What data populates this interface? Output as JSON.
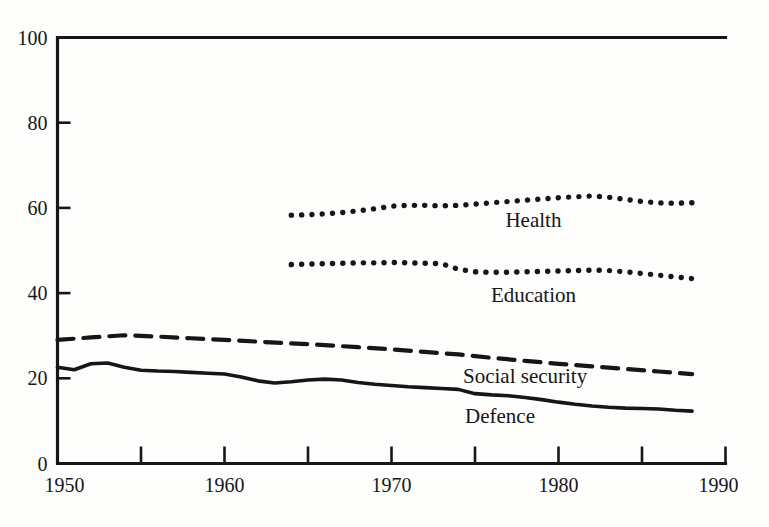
{
  "chart_data": {
    "type": "line",
    "title": "",
    "subtitle": "",
    "xlabel": "",
    "ylabel": "",
    "xlim": [
      1950,
      1990
    ],
    "ylim": [
      0,
      100
    ],
    "grid": false,
    "legend_position": "inline-labels",
    "x_ticks": [
      1950,
      1955,
      1960,
      1965,
      1970,
      1975,
      1980,
      1985,
      1990
    ],
    "x_tick_labels": [
      "1950",
      "",
      "1960",
      "",
      "1970",
      "",
      "1980",
      "",
      "1990"
    ],
    "y_ticks": [
      0,
      20,
      40,
      60,
      80,
      100
    ],
    "y_tick_labels": [
      "0",
      "20",
      "40",
      "60",
      "80",
      "100"
    ],
    "series": [
      {
        "name": "Health",
        "label": "Health",
        "style": "dotted",
        "color": "#16161a",
        "x": [
          1964,
          1965,
          1966,
          1967,
          1968,
          1969,
          1970,
          1971,
          1972,
          1973,
          1974,
          1975,
          1976,
          1977,
          1978,
          1979,
          1980,
          1981,
          1982,
          1983,
          1984,
          1985,
          1986,
          1987,
          1988
        ],
        "values": [
          58.3,
          58.4,
          58.6,
          58.9,
          59.3,
          59.8,
          60.4,
          60.6,
          60.6,
          60.5,
          60.6,
          60.9,
          61.2,
          61.5,
          61.8,
          62.1,
          62.4,
          62.6,
          62.8,
          62.5,
          62.0,
          61.5,
          61.2,
          61.1,
          61.2
        ]
      },
      {
        "name": "Education",
        "label": "Education",
        "style": "dotted",
        "color": "#16161a",
        "x": [
          1964,
          1965,
          1966,
          1967,
          1968,
          1969,
          1970,
          1971,
          1972,
          1973,
          1974,
          1975,
          1976,
          1977,
          1978,
          1979,
          1980,
          1981,
          1982,
          1983,
          1984,
          1985,
          1986,
          1987,
          1988
        ],
        "values": [
          46.7,
          46.8,
          46.9,
          47.0,
          47.1,
          47.1,
          47.2,
          47.1,
          47.0,
          46.9,
          45.6,
          45.0,
          44.9,
          44.9,
          45.0,
          45.1,
          45.2,
          45.3,
          45.4,
          45.3,
          45.0,
          44.6,
          44.2,
          43.8,
          43.4
        ]
      },
      {
        "name": "Social security",
        "label": "Social security",
        "style": "dashed",
        "color": "#16161a",
        "x": [
          1950,
          1952,
          1954,
          1956,
          1958,
          1960,
          1962,
          1964,
          1966,
          1968,
          1970,
          1972,
          1974,
          1976,
          1978,
          1980,
          1982,
          1984,
          1986,
          1988
        ],
        "values": [
          29.0,
          29.6,
          30.1,
          29.8,
          29.4,
          29.0,
          28.6,
          28.2,
          27.8,
          27.3,
          26.8,
          26.2,
          25.6,
          24.8,
          24.1,
          23.4,
          22.8,
          22.2,
          21.6,
          21.0
        ]
      },
      {
        "name": "Defence",
        "label": "Defence",
        "style": "solid",
        "color": "#16161a",
        "x": [
          1950,
          1951,
          1952,
          1953,
          1954,
          1955,
          1956,
          1957,
          1958,
          1959,
          1960,
          1961,
          1962,
          1963,
          1964,
          1965,
          1966,
          1967,
          1968,
          1969,
          1970,
          1971,
          1972,
          1973,
          1974,
          1975,
          1976,
          1977,
          1978,
          1979,
          1980,
          1981,
          1982,
          1983,
          1984,
          1985,
          1986,
          1987,
          1988
        ],
        "values": [
          22.6,
          22.0,
          23.4,
          23.6,
          22.6,
          21.9,
          21.7,
          21.6,
          21.4,
          21.2,
          21.0,
          20.3,
          19.4,
          18.9,
          19.2,
          19.6,
          19.8,
          19.6,
          19.0,
          18.6,
          18.3,
          18.0,
          17.8,
          17.6,
          17.4,
          16.4,
          16.1,
          15.9,
          15.5,
          15.0,
          14.4,
          13.9,
          13.5,
          13.2,
          13.0,
          12.9,
          12.8,
          12.5,
          12.3
        ]
      }
    ],
    "inline_labels": [
      {
        "text": "Health",
        "x": 1978.5,
        "y": 55.5
      },
      {
        "text": "Education",
        "x": 1978.5,
        "y": 38.0
      },
      {
        "text": "Social security",
        "x": 1978.0,
        "y": 18.8
      },
      {
        "text": "Defence",
        "x": 1976.5,
        "y": 9.5
      }
    ]
  }
}
